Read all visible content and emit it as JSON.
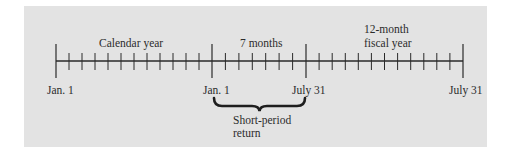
{
  "diagram": {
    "type": "timeline",
    "background_color": "#e3e3e3",
    "line_color": "#2a2a2a",
    "segments": [
      {
        "label": "Calendar year",
        "months": 12
      },
      {
        "label": "7 months",
        "months": 7
      },
      {
        "label_line1": "12-month",
        "label_line2": "fiscal year",
        "months": 12
      }
    ],
    "date_labels": [
      "Jan. 1",
      "Jan. 1",
      "July 31",
      "July 31"
    ],
    "brace": {
      "label_line1": "Short-period",
      "label_line2": "return"
    }
  }
}
